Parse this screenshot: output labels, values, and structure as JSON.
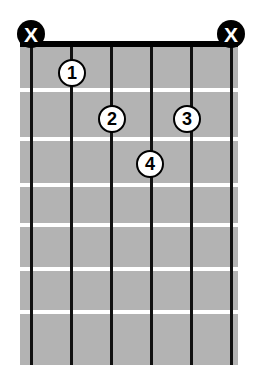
{
  "diagram": {
    "type": "guitar-chord-diagram",
    "title": "",
    "colors": {
      "background": "#ffffff",
      "fretboard": "#b3b3b3",
      "string": "#111111",
      "fret": "#ffffff",
      "nut": "#000000",
      "marker_fill": "#000000",
      "marker_text": "#ffffff",
      "dot_fill": "#ffffff",
      "dot_border": "#000000",
      "dot_text": "#000000"
    },
    "geometry": {
      "board_left": 20,
      "board_top": 47,
      "board_width": 218,
      "board_height": 318,
      "nut_top": 41,
      "nut_height": 6,
      "string_width": 3,
      "fret_height": 4,
      "marker_radius": 14
    },
    "strings": [
      {
        "index": 1,
        "name": "string-6-low-e",
        "x": 31
      },
      {
        "index": 2,
        "name": "string-5-a",
        "x": 71
      },
      {
        "index": 3,
        "name": "string-4-d",
        "x": 111
      },
      {
        "index": 4,
        "name": "string-3-g",
        "x": 151
      },
      {
        "index": 5,
        "name": "string-2-b",
        "x": 191
      },
      {
        "index": 6,
        "name": "string-1-high-e",
        "x": 231
      }
    ],
    "frets": [
      {
        "index": 1,
        "y": 88
      },
      {
        "index": 2,
        "y": 137
      },
      {
        "index": 3,
        "y": 183
      },
      {
        "index": 4,
        "y": 223
      },
      {
        "index": 5,
        "y": 267
      },
      {
        "index": 6,
        "y": 310
      }
    ],
    "muted_strings": [
      {
        "label": "X",
        "string": 1,
        "x": 31,
        "y": 34
      },
      {
        "label": "X",
        "string": 6,
        "x": 231,
        "y": 34
      }
    ],
    "finger_positions": [
      {
        "label": "1",
        "string": 2,
        "fret": 1,
        "x": 72,
        "y": 73
      },
      {
        "label": "2",
        "string": 3,
        "fret": 2,
        "x": 112,
        "y": 119
      },
      {
        "label": "3",
        "string": 5,
        "fret": 2,
        "x": 187,
        "y": 119
      },
      {
        "label": "4",
        "string": 4,
        "fret": 3,
        "x": 150,
        "y": 164
      }
    ]
  }
}
